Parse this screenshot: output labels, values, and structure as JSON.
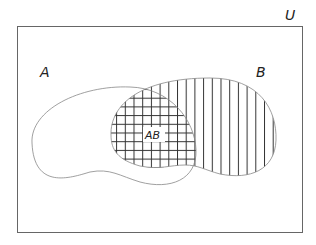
{
  "diagram": {
    "type": "venn",
    "universe_label": "U",
    "sets": [
      {
        "name": "A",
        "label": "A",
        "pattern": "none"
      },
      {
        "name": "B",
        "label": "B",
        "pattern": "vertical-lines"
      }
    ],
    "intersection": {
      "label": "AB",
      "pattern": "crosshatch"
    },
    "colors": {
      "stroke": "#888888",
      "hatch": "#333333",
      "frame": "#666666"
    }
  }
}
